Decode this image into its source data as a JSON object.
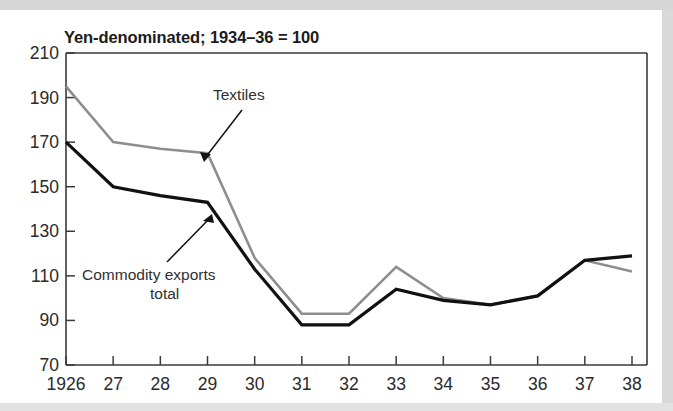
{
  "figure": {
    "title": "Yen-denominated; 1934–36 = 100",
    "background_color": "#ffffff",
    "frame_color": "#3a3a3a"
  },
  "annotations": [
    {
      "name": "textiles",
      "label": "Textiles",
      "lines": [
        "Textiles"
      ]
    },
    {
      "name": "commodity-exports-total",
      "label": "Commodity exports total",
      "lines": [
        "Commodity exports",
        "total"
      ]
    }
  ],
  "axes": {
    "y_ticks": [
      "210",
      "190",
      "170",
      "150",
      "130",
      "110",
      "90",
      "70"
    ],
    "x_ticks": [
      "1926",
      "27",
      "28",
      "29",
      "30",
      "31",
      "32",
      "33",
      "34",
      "35",
      "36",
      "37",
      "38"
    ]
  },
  "chart_data": {
    "type": "line",
    "title": "Yen-denominated; 1934–36 = 100",
    "xlabel": "",
    "ylabel": "",
    "xlim": [
      1926,
      1938
    ],
    "ylim": [
      70,
      210
    ],
    "ytick_values": [
      70,
      90,
      110,
      130,
      150,
      170,
      190,
      210
    ],
    "grid": false,
    "legend_position": "inline-annotations",
    "x": [
      1926,
      1927,
      1928,
      1929,
      1930,
      1931,
      1932,
      1933,
      1934,
      1935,
      1936,
      1937,
      1938
    ],
    "categories": [
      "1926",
      "27",
      "28",
      "29",
      "30",
      "31",
      "32",
      "33",
      "34",
      "35",
      "36",
      "37",
      "38"
    ],
    "series": [
      {
        "name": "Textiles",
        "color": "#8e8e8e",
        "values": [
          195,
          170,
          167,
          165,
          118,
          93,
          93,
          114,
          100,
          97,
          101,
          117,
          112
        ]
      },
      {
        "name": "Commodity exports total",
        "color": "#111111",
        "values": [
          170,
          150,
          146,
          143,
          113,
          88,
          88,
          104,
          99,
          97,
          101,
          117,
          119
        ]
      }
    ]
  }
}
